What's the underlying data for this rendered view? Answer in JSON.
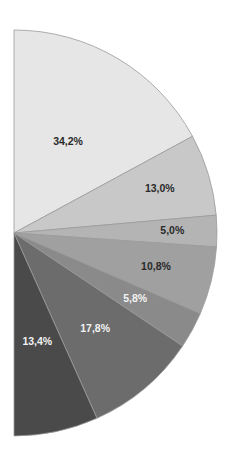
{
  "chart_data": {
    "type": "pie",
    "variant": "half-pie (semicircle, right half)",
    "title": "",
    "legend": "none",
    "categories": [
      "Slice 1",
      "Slice 2",
      "Slice 3",
      "Slice 4",
      "Slice 5",
      "Slice 6",
      "Slice 7"
    ],
    "values": [
      34.2,
      13.0,
      5.0,
      10.8,
      5.8,
      17.8,
      13.4
    ],
    "labels": [
      "34,2%",
      "13,0%",
      "5,0%",
      "10,8%",
      "5,8%",
      "17,8%",
      "13,4%"
    ],
    "colors": [
      "#e6e6e6",
      "#c8c8c8",
      "#b4b4b4",
      "#a0a0a0",
      "#8a8a8a",
      "#6c6c6c",
      "#4a4a4a"
    ],
    "label_colors": [
      "#2a2a2a",
      "#2a2a2a",
      "#2a2a2a",
      "#2a2a2a",
      "#f2f2f2",
      "#f2f2f2",
      "#f2f2f2"
    ],
    "geometry": {
      "cx": 14,
      "cy": 233,
      "r": 203,
      "start_angle_deg": -90,
      "sweep_deg": 180
    }
  }
}
